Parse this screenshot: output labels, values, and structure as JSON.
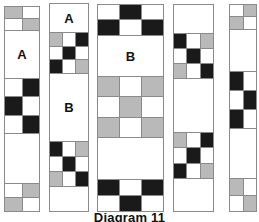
{
  "figure": {
    "caption": "Diagram 11",
    "colors": {
      "white": "#ffffff",
      "gray": "#b9b9b9",
      "black": "#1a1a1a",
      "outline": "#8a8a8a",
      "text": "#111111"
    },
    "columns": [
      {
        "name": "column-1",
        "label": null,
        "blocks": [
          {
            "name": "checker-2x2-top",
            "label": null,
            "rows": [
              [
                "gray",
                "white"
              ],
              [
                "white",
                "gray"
              ]
            ]
          },
          {
            "name": "plain-block-a",
            "label": "A",
            "rows": [
              [
                "white"
              ]
            ]
          },
          {
            "name": "checker-2x3",
            "label": null,
            "rows": [
              [
                "white",
                "black"
              ],
              [
                "black",
                "white"
              ],
              [
                "white",
                "black"
              ]
            ]
          },
          {
            "name": "plain-block",
            "label": null,
            "rows": [
              [
                "white"
              ]
            ]
          },
          {
            "name": "checker-2x2-bottom",
            "label": null,
            "rows": [
              [
                "white",
                "gray"
              ],
              [
                "gray",
                "white"
              ]
            ]
          }
        ]
      },
      {
        "name": "column-2",
        "label": null,
        "blocks": [
          {
            "name": "plain-block-a",
            "label": "A",
            "rows": [
              [
                "white"
              ]
            ]
          },
          {
            "name": "checker-3x3-top",
            "label": null,
            "rows": [
              [
                "gray",
                "white",
                "black"
              ],
              [
                "white",
                "black",
                "white"
              ],
              [
                "black",
                "white",
                "gray"
              ]
            ]
          },
          {
            "name": "plain-block-b",
            "label": "B",
            "rows": [
              [
                "white"
              ]
            ]
          },
          {
            "name": "checker-3x3-bottom",
            "label": null,
            "rows": [
              [
                "black",
                "white",
                "gray"
              ],
              [
                "white",
                "black",
                "white"
              ],
              [
                "gray",
                "white",
                "black"
              ]
            ]
          },
          {
            "name": "plain-block",
            "label": null,
            "rows": [
              [
                "white"
              ]
            ]
          }
        ]
      },
      {
        "name": "column-3",
        "label": null,
        "blocks": [
          {
            "name": "checker-3x2-top",
            "label": null,
            "rows": [
              [
                "white",
                "black",
                "white"
              ],
              [
                "black",
                "white",
                "black"
              ]
            ]
          },
          {
            "name": "plain-block-b",
            "label": "B",
            "rows": [
              [
                "white"
              ]
            ]
          },
          {
            "name": "checker-3x3-gray",
            "label": null,
            "rows": [
              [
                "gray",
                "white",
                "gray"
              ],
              [
                "white",
                "gray",
                "white"
              ],
              [
                "gray",
                "white",
                "gray"
              ]
            ]
          },
          {
            "name": "plain-block",
            "label": null,
            "rows": [
              [
                "white"
              ]
            ]
          },
          {
            "name": "checker-3x2-bottom",
            "label": null,
            "rows": [
              [
                "black",
                "white",
                "black"
              ],
              [
                "white",
                "black",
                "white"
              ]
            ]
          }
        ]
      },
      {
        "name": "column-4",
        "label": null,
        "blocks": [
          {
            "name": "plain-block-top",
            "label": null,
            "rows": [
              [
                "white"
              ]
            ]
          },
          {
            "name": "checker-3x3-top",
            "label": null,
            "rows": [
              [
                "black",
                "white",
                "gray"
              ],
              [
                "white",
                "black",
                "white"
              ],
              [
                "gray",
                "white",
                "black"
              ]
            ]
          },
          {
            "name": "plain-block-middle",
            "label": null,
            "rows": [
              [
                "white"
              ]
            ]
          },
          {
            "name": "checker-3x3-bottom",
            "label": null,
            "rows": [
              [
                "gray",
                "white",
                "black"
              ],
              [
                "white",
                "black",
                "white"
              ],
              [
                "black",
                "white",
                "gray"
              ]
            ]
          },
          {
            "name": "plain-block-bottom",
            "label": null,
            "rows": [
              [
                "white"
              ]
            ]
          }
        ]
      },
      {
        "name": "column-5",
        "label": null,
        "blocks": [
          {
            "name": "checker-2x2-top",
            "label": null,
            "rows": [
              [
                "white",
                "gray"
              ],
              [
                "gray",
                "white"
              ]
            ]
          },
          {
            "name": "plain-block",
            "label": null,
            "rows": [
              [
                "white"
              ]
            ]
          },
          {
            "name": "checker-2x3",
            "label": null,
            "rows": [
              [
                "black",
                "white"
              ],
              [
                "white",
                "black"
              ],
              [
                "black",
                "white"
              ]
            ]
          },
          {
            "name": "plain-block-lower",
            "label": null,
            "rows": [
              [
                "white"
              ]
            ]
          },
          {
            "name": "checker-2x2-bottom",
            "label": null,
            "rows": [
              [
                "gray",
                "white"
              ],
              [
                "white",
                "gray"
              ]
            ]
          }
        ]
      }
    ]
  }
}
